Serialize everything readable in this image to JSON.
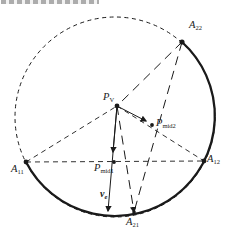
{
  "figure": {
    "ink": "#1a1a1a",
    "background": "#ffffff"
  },
  "labels": [
    {
      "id": "A22",
      "base": "A",
      "sub": "22",
      "x": 189,
      "y": 20,
      "bold": false
    },
    {
      "id": "A12",
      "base": "A",
      "sub": "12",
      "x": 207,
      "y": 154,
      "bold": false
    },
    {
      "id": "A11",
      "base": "A",
      "sub": "11",
      "x": 11,
      "y": 164,
      "bold": false
    },
    {
      "id": "A21",
      "base": "A",
      "sub": "21",
      "x": 126,
      "y": 217,
      "bold": false
    },
    {
      "id": "PV",
      "base": "P",
      "sub": "V",
      "x": 103,
      "y": 92,
      "bold": false
    },
    {
      "id": "Pmid2",
      "base": "P",
      "sub": "mid2",
      "x": 156,
      "y": 118,
      "bold": false
    },
    {
      "id": "Pmid1",
      "base": "P",
      "sub": "mid1",
      "x": 94,
      "y": 163,
      "bold": false
    },
    {
      "id": "ve",
      "base": "v",
      "sub": "e",
      "x": 100,
      "y": 189,
      "bold": true
    }
  ],
  "geometry": {
    "ink": "#1a1a1a",
    "circle": {
      "cx": 115,
      "cy": 117,
      "r": 100,
      "dash": "4 3.5"
    },
    "solid_arc": {
      "path": "M 182 42 A 100 100 0 1 1 26 162",
      "width": 2.3
    },
    "points": {
      "A11": [
        26,
        162
      ],
      "A12": [
        204,
        161
      ],
      "A22": [
        182,
        42
      ],
      "A21": [
        134,
        212
      ],
      "PV": [
        117,
        106
      ],
      "PM1": [
        114,
        162
      ],
      "PM2": [
        152,
        125
      ],
      "VE_END": [
        108,
        211
      ],
      "PM2_END": [
        146,
        121
      ],
      "PM1_END": [
        113,
        152
      ]
    },
    "lines": [
      {
        "name": "chord-A11-A12",
        "from": "A11",
        "to": "A12",
        "dash": "5 4",
        "w": 0.9
      },
      {
        "name": "edge-A11-PV",
        "from": "A11",
        "to": "PV",
        "dash": "5 4",
        "w": 0.9
      },
      {
        "name": "edge-PV-A12",
        "from": "PV",
        "to": "A12",
        "dash": "5 4",
        "w": 0.9
      },
      {
        "name": "edge-A22-PV",
        "from": "A22",
        "to": "PV",
        "dash": "9 6",
        "w": 1
      },
      {
        "name": "chord-A22-A21",
        "from": "A22",
        "to": "A21",
        "dash": "9 6",
        "w": 1
      },
      {
        "name": "edge-PV-A21",
        "from": "PV",
        "to": "A21",
        "dash": "9 6",
        "w": 1,
        "arrow": true
      },
      {
        "name": "vector-ve",
        "from": "PV",
        "to": "VE_END",
        "w": 1,
        "arrow": true
      },
      {
        "name": "vector-PV-Pmid2",
        "from": "PV",
        "to": "PM2_END",
        "w": 1,
        "arrow": true
      },
      {
        "name": "vector-PV-Pmid1",
        "from": "PV",
        "to": "PM1_END",
        "w": 1,
        "arrow": true
      }
    ],
    "dots": [
      {
        "at": "PV",
        "r": 2.4
      },
      {
        "at": "A11",
        "r": 2.4
      },
      {
        "at": "A12",
        "r": 2.4
      },
      {
        "at": "A22",
        "r": 2.6
      },
      {
        "at": "A21",
        "r": 1.8
      },
      {
        "at": "PM1",
        "r": 1.9
      },
      {
        "at": "PM2",
        "r": 1.9
      }
    ]
  }
}
